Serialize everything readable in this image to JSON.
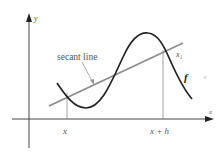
{
  "diagram": {
    "axes": {
      "x_label": "x",
      "y_label": "y"
    },
    "curve": {
      "label": "f",
      "color": "#222222"
    },
    "secant": {
      "label": "secant line",
      "color": "#8a8a8a"
    },
    "points": {
      "p1_label": "x",
      "p2_label": "x + h",
      "intersection_label": "x₁"
    },
    "stray_mark": "e",
    "colors": {
      "axis": "#333333",
      "guide": "#999999",
      "text": "#555555"
    }
  }
}
